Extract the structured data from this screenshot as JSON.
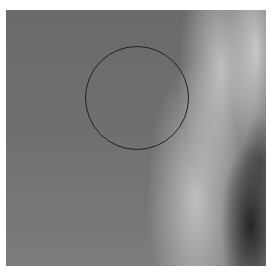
{
  "image": {
    "kind": "radiograph",
    "annotation": {
      "shape": "circle",
      "center_x": 137,
      "center_y": 98,
      "radius": 52,
      "stroke_color": "#222222"
    },
    "colors": {
      "background_tissue": "#6e6e6e",
      "dense_tissue": "#dcdcdc",
      "dark_region": "#1e1e1e",
      "margin": "#ffffff"
    }
  }
}
